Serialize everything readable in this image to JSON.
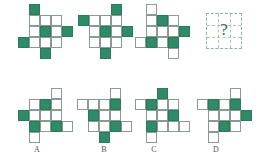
{
  "puzzle": {
    "cell_colors": {
      "dark": "#2f8a68",
      "light": "#ffffff",
      "grid": "#8a9a92"
    },
    "sequence": [
      {
        "name": "figure-1",
        "origin": [
          18,
          4
        ],
        "cells": [
          [
            1,
            0,
            "dark"
          ],
          [
            1,
            1,
            "light"
          ],
          [
            2,
            1,
            "light"
          ],
          [
            3,
            1,
            "light"
          ],
          [
            1,
            2,
            "light"
          ],
          [
            2,
            2,
            "dark"
          ],
          [
            3,
            2,
            "light"
          ],
          [
            4,
            2,
            "dark"
          ],
          [
            0,
            3,
            "dark"
          ],
          [
            1,
            3,
            "light"
          ],
          [
            2,
            3,
            "light"
          ],
          [
            3,
            3,
            "light"
          ],
          [
            2,
            4,
            "dark"
          ]
        ]
      },
      {
        "name": "figure-2",
        "origin": [
          78,
          4
        ],
        "cells": [
          [
            3,
            0,
            "dark"
          ],
          [
            0,
            1,
            "dark"
          ],
          [
            1,
            1,
            "light"
          ],
          [
            2,
            1,
            "light"
          ],
          [
            3,
            1,
            "light"
          ],
          [
            1,
            2,
            "light"
          ],
          [
            2,
            2,
            "dark"
          ],
          [
            3,
            2,
            "light"
          ],
          [
            4,
            2,
            "dark"
          ],
          [
            1,
            3,
            "light"
          ],
          [
            2,
            3,
            "light"
          ],
          [
            3,
            3,
            "light"
          ],
          [
            2,
            4,
            "dark"
          ]
        ]
      },
      {
        "name": "figure-3",
        "origin": [
          135,
          4
        ],
        "cells": [
          [
            1,
            0,
            "light"
          ],
          [
            1,
            1,
            "light"
          ],
          [
            2,
            1,
            "dark"
          ],
          [
            3,
            1,
            "light"
          ],
          [
            1,
            2,
            "light"
          ],
          [
            2,
            2,
            "light"
          ],
          [
            3,
            2,
            "light"
          ],
          [
            4,
            2,
            "dark"
          ],
          [
            0,
            3,
            "light"
          ],
          [
            1,
            3,
            "dark"
          ],
          [
            2,
            3,
            "light"
          ],
          [
            3,
            3,
            "dark"
          ],
          [
            3,
            4,
            "light"
          ]
        ]
      }
    ],
    "question": {
      "mark": "?"
    },
    "options": [
      {
        "label": "A",
        "origin": [
          18,
          88
        ],
        "label_x": 31,
        "cells": [
          [
            3,
            0,
            "light"
          ],
          [
            1,
            1,
            "light"
          ],
          [
            2,
            1,
            "dark"
          ],
          [
            3,
            1,
            "light"
          ],
          [
            0,
            2,
            "dark"
          ],
          [
            1,
            2,
            "light"
          ],
          [
            2,
            2,
            "light"
          ],
          [
            3,
            2,
            "light"
          ],
          [
            1,
            3,
            "dark"
          ],
          [
            2,
            3,
            "light"
          ],
          [
            3,
            3,
            "dark"
          ],
          [
            4,
            3,
            "light"
          ],
          [
            1,
            4,
            "light"
          ]
        ]
      },
      {
        "label": "B",
        "origin": [
          77,
          88
        ],
        "label_x": 98,
        "cells": [
          [
            3,
            0,
            "light"
          ],
          [
            0,
            1,
            "light"
          ],
          [
            1,
            1,
            "light"
          ],
          [
            2,
            1,
            "light"
          ],
          [
            3,
            1,
            "dark"
          ],
          [
            1,
            2,
            "dark"
          ],
          [
            2,
            2,
            "light"
          ],
          [
            3,
            2,
            "light"
          ],
          [
            1,
            3,
            "light"
          ],
          [
            2,
            3,
            "light"
          ],
          [
            3,
            3,
            "dark"
          ],
          [
            4,
            3,
            "light"
          ],
          [
            2,
            4,
            "dark"
          ]
        ]
      },
      {
        "label": "C",
        "origin": [
          135,
          88
        ],
        "label_x": 148,
        "cells": [
          [
            2,
            0,
            "dark"
          ],
          [
            0,
            1,
            "light"
          ],
          [
            1,
            1,
            "dark"
          ],
          [
            2,
            1,
            "light"
          ],
          [
            3,
            1,
            "light"
          ],
          [
            1,
            2,
            "light"
          ],
          [
            2,
            2,
            "light"
          ],
          [
            3,
            2,
            "dark"
          ],
          [
            1,
            3,
            "dark"
          ],
          [
            2,
            3,
            "light"
          ],
          [
            3,
            3,
            "light"
          ],
          [
            4,
            3,
            "light"
          ],
          [
            1,
            4,
            "light"
          ]
        ]
      },
      {
        "label": "D",
        "origin": [
          197,
          88
        ],
        "label_x": 210,
        "cells": [
          [
            3,
            0,
            "light"
          ],
          [
            0,
            1,
            "light"
          ],
          [
            1,
            1,
            "dark"
          ],
          [
            2,
            1,
            "light"
          ],
          [
            3,
            1,
            "dark"
          ],
          [
            1,
            2,
            "light"
          ],
          [
            2,
            2,
            "light"
          ],
          [
            3,
            2,
            "light"
          ],
          [
            4,
            2,
            "dark"
          ],
          [
            1,
            3,
            "light"
          ],
          [
            2,
            3,
            "dark"
          ],
          [
            3,
            3,
            "light"
          ],
          [
            1,
            4,
            "light"
          ]
        ]
      }
    ]
  }
}
